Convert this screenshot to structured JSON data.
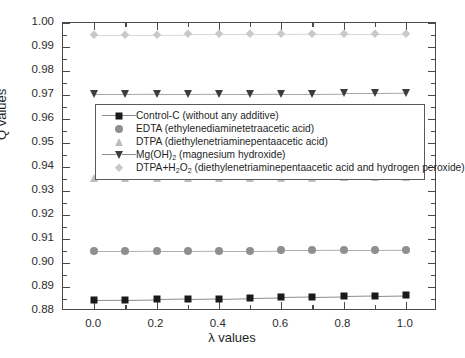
{
  "chart_data": {
    "type": "line",
    "title": "",
    "xlabel": "λ values",
    "ylabel": "Q values",
    "xlim": [
      -0.1,
      1.1
    ],
    "ylim": [
      0.88,
      1.0
    ],
    "grid": false,
    "legend_position": "upper-left-inside",
    "x": [
      0.0,
      0.1,
      0.2,
      0.3,
      0.4,
      0.5,
      0.6,
      0.7,
      0.8,
      0.9,
      1.0
    ],
    "x_tick_labels": [
      "0.0",
      "0.2",
      "0.4",
      "0.6",
      "0.8",
      "1.0"
    ],
    "x_tick_values": [
      0.0,
      0.2,
      0.4,
      0.6,
      0.8,
      1.0
    ],
    "x_minor_tick_values": [
      0.1,
      0.3,
      0.5,
      0.7,
      0.9
    ],
    "y_tick_labels": [
      "0.88",
      "0.89",
      "0.90",
      "0.91",
      "0.92",
      "0.93",
      "0.94",
      "0.95",
      "0.96",
      "0.97",
      "0.98",
      "0.99",
      "1.00"
    ],
    "y_tick_values": [
      0.88,
      0.89,
      0.9,
      0.91,
      0.92,
      0.93,
      0.94,
      0.95,
      0.96,
      0.97,
      0.98,
      0.99,
      1.0
    ],
    "y_minor_tick_values": [
      0.885,
      0.895,
      0.905,
      0.915,
      0.925,
      0.935,
      0.945,
      0.955,
      0.965,
      0.975,
      0.985,
      0.995
    ],
    "series": [
      {
        "name": "Control-C (without any additive)",
        "marker": "square",
        "color": "#1a1a1a",
        "line_color": "#8c8c8c",
        "values": [
          0.8845,
          0.8846,
          0.8848,
          0.885,
          0.8852,
          0.8855,
          0.8857,
          0.8859,
          0.8861,
          0.8863,
          0.8865
        ]
      },
      {
        "name": "EDTA (ethylenediaminetetraacetic acid)",
        "marker": "circle",
        "color": "#8f8f8f",
        "line_color": "#b0b0b0",
        "values": [
          0.905,
          0.905,
          0.9051,
          0.9051,
          0.9052,
          0.9052,
          0.9053,
          0.9053,
          0.9054,
          0.9054,
          0.9055
        ]
      },
      {
        "name": "DTPA (diethylenetriaminepentaacetic acid)",
        "marker": "triangle-up",
        "color": "#bdbdbd",
        "line_color": "#cecece",
        "values": [
          0.9353,
          0.9353,
          0.9354,
          0.9354,
          0.9355,
          0.9355,
          0.9356,
          0.9356,
          0.9357,
          0.9357,
          0.9358
        ]
      },
      {
        "name": "Mg(OH)2 (magnesium hydroxide)",
        "marker": "triangle-down",
        "color": "#3c3c3c",
        "line_color": "#a8a8a8",
        "values": [
          0.9703,
          0.9703,
          0.9704,
          0.9704,
          0.9705,
          0.9705,
          0.9706,
          0.9706,
          0.9707,
          0.9707,
          0.9708
        ]
      },
      {
        "name": "DTPA+H2O2 (diethylenetriaminepentaacetic acid and hydrogen peroxide)",
        "marker": "diamond",
        "color": "#c9c9c9",
        "line_color": "#d8d8d8",
        "values": [
          0.9952,
          0.9952,
          0.9952,
          0.9953,
          0.9953,
          0.9953,
          0.9953,
          0.9954,
          0.9954,
          0.9954,
          0.9954
        ]
      }
    ]
  },
  "legend": {
    "entries": [
      {
        "label_html": "Control-C (without any additive)",
        "marker": "square",
        "color": "#1a1a1a",
        "has_line": true
      },
      {
        "label_html": "EDTA (ethylenediaminetetraacetic acid)",
        "marker": "circle",
        "color": "#8f8f8f",
        "has_line": false
      },
      {
        "label_html": "DTPA (diethylenetriaminepentaacetic acid)",
        "marker": "triangle-up",
        "color": "#bdbdbd",
        "has_line": false
      },
      {
        "label_html": "Mg(OH)<sub>2</sub> (magnesium hydroxide)",
        "marker": "triangle-down",
        "color": "#3c3c3c",
        "has_line": true
      },
      {
        "label_html": "DTPA+H<sub>2</sub>O<sub>2</sub> (diethylenetriaminepentaacetic acid and hydrogen peroxide)",
        "marker": "diamond",
        "color": "#c9c9c9",
        "has_line": false
      }
    ]
  },
  "axes": {
    "frame_color": "#4a4a4a"
  }
}
